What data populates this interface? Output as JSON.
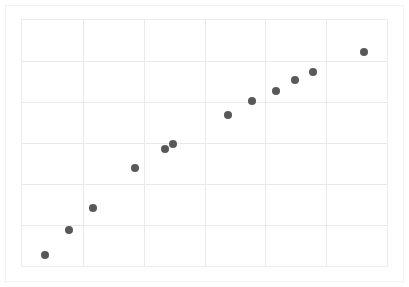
{
  "figure": {
    "background_color": "#ffffff",
    "frame_color": "#f2f2f2",
    "plot_border_color": "#ededed",
    "grid_color": "#e9e9e9",
    "marker_color": "#585858",
    "marker_diameter_px": 8
  },
  "chart_data": {
    "type": "scatter",
    "title": "",
    "subtitle": "",
    "xlabel": "",
    "ylabel": "",
    "legend": [],
    "annotations": [],
    "grid": true,
    "x_ticks": [],
    "y_ticks": [],
    "xlim": [
      0,
      12
    ],
    "ylim": [
      0,
      12
    ],
    "x_gridlines": [
      2,
      4,
      6,
      8,
      10
    ],
    "y_gridlines": [
      2,
      4,
      6,
      8,
      10
    ],
    "series": [
      {
        "name": "series-1",
        "marker": "circle",
        "color": "#585858",
        "x": [
          0.77,
          1.54,
          2.32,
          3.7,
          4.68,
          4.94,
          6.74,
          7.52,
          8.31,
          8.93,
          9.52,
          11.19
        ],
        "y": [
          0.61,
          1.87,
          2.95,
          4.89,
          5.81,
          6.05,
          7.45,
          8.13,
          8.61,
          9.14,
          9.53,
          10.5
        ],
        "points_px": [
          {
            "cx": 44,
            "cy": 254
          },
          {
            "cx": 68,
            "cy": 229
          },
          {
            "cx": 92,
            "cy": 207
          },
          {
            "cx": 134,
            "cy": 167
          },
          {
            "cx": 164,
            "cy": 148
          },
          {
            "cx": 172,
            "cy": 143
          },
          {
            "cx": 227,
            "cy": 114
          },
          {
            "cx": 251,
            "cy": 100
          },
          {
            "cx": 275,
            "cy": 90
          },
          {
            "cx": 294,
            "cy": 79
          },
          {
            "cx": 312,
            "cy": 71
          },
          {
            "cx": 363,
            "cy": 51
          }
        ]
      }
    ]
  }
}
